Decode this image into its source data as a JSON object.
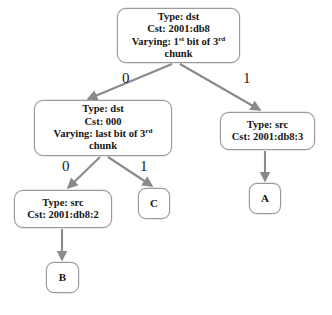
{
  "diagram": {
    "background_color": "#ffffff",
    "node_border_color": "#9a9a9a",
    "edge_color": "#8a8a8a",
    "text_color": "#151515",
    "nodes": [
      {
        "id": "root",
        "kind": "internal",
        "type_line": "Type: dst",
        "cst_line": "Cst: 2001:db8",
        "varying_prefix": "Varying: 1",
        "varying_sup1": "st",
        "varying_mid": " bit of 3",
        "varying_sup2": "rd",
        "varying_suffix": " chunk",
        "x": 117,
        "y": 8,
        "w": 123,
        "h": 55
      },
      {
        "id": "n-left",
        "kind": "internal",
        "type_line": "Type: dst",
        "cst_line": "Cst: 000",
        "varying_prefix": "Varying: last bit of 3",
        "varying_sup1": "",
        "varying_mid": "",
        "varying_sup2": "rd",
        "varying_suffix": " chunk",
        "x": 34,
        "y": 100,
        "w": 138,
        "h": 56
      },
      {
        "id": "n-right",
        "kind": "internal",
        "type_line": "Type: src",
        "cst_line": "Cst: 2001:db8:3",
        "x": 220,
        "y": 112,
        "w": 95,
        "h": 38
      },
      {
        "id": "n-left-left",
        "kind": "internal",
        "type_line": "Type: src",
        "cst_line": "Cst: 2001:db8:2",
        "x": 14,
        "y": 190,
        "w": 98,
        "h": 38
      },
      {
        "id": "leaf-c",
        "kind": "leaf",
        "label": "C",
        "x": 138,
        "y": 188,
        "w": 32,
        "h": 31
      },
      {
        "id": "leaf-a",
        "kind": "leaf",
        "label": "A",
        "x": 249,
        "y": 183,
        "w": 32,
        "h": 31
      },
      {
        "id": "leaf-b",
        "kind": "leaf",
        "label": "B",
        "x": 46,
        "y": 262,
        "w": 33,
        "h": 31
      }
    ],
    "edges": [
      {
        "id": "root-to-left",
        "from": "root",
        "to": "n-left",
        "label": "0",
        "label_x": 122,
        "label_y": 71
      },
      {
        "id": "root-to-right",
        "from": "root",
        "to": "n-right",
        "label": "1",
        "label_x": 243,
        "label_y": 71
      },
      {
        "id": "left-to-leftleft",
        "from": "n-left",
        "to": "n-left-left",
        "label": "0",
        "label_x": 62,
        "label_y": 159
      },
      {
        "id": "left-to-c",
        "from": "n-left",
        "to": "leaf-c",
        "label": "1",
        "label_x": 140,
        "label_y": 159
      },
      {
        "id": "right-to-a",
        "from": "n-right",
        "to": "leaf-a",
        "label": "",
        "label_x": 0,
        "label_y": 0
      },
      {
        "id": "leftleft-to-b",
        "from": "n-left-left",
        "to": "leaf-b",
        "label": "",
        "label_x": 0,
        "label_y": 0
      }
    ]
  }
}
